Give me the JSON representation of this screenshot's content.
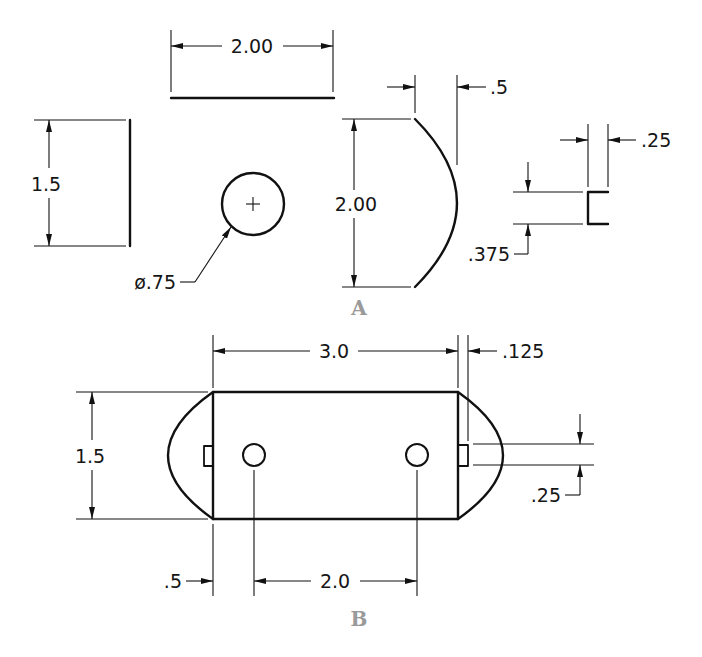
{
  "figure": {
    "panels": [
      {
        "label": "A",
        "dimensions": {
          "line_length": "2.00",
          "vertical_line": "1.5",
          "circle_diameter": "ø.75",
          "arc_chord": "2.00",
          "arc_depth": ".5",
          "bracket_width": ".25",
          "bracket_height": ".375"
        }
      },
      {
        "label": "B",
        "dimensions": {
          "overall_length": "3.0",
          "height": "1.5",
          "slot_depth": ".125",
          "slot_width": ".25",
          "hole_offset": ".5",
          "hole_spacing": "2.0"
        }
      }
    ],
    "colors": {
      "line": "#111111",
      "panel_label": "#9a9a9a",
      "background": "#ffffff"
    }
  }
}
